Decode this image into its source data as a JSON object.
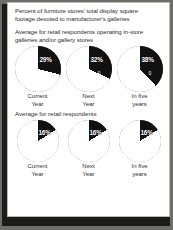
{
  "figure": {
    "title_lines": [
      "Percent of furniture stores' total display square",
      "footage devoted to manufacturer's galleries"
    ],
    "subtitle_lines": [
      "Average for retail respondents operating in-store",
      "galleries and/or gallery stores"
    ],
    "section_label": "Average for retail respondents"
  },
  "chart_data": {
    "type": "pie",
    "title": "Percent of furniture stores' total display square footage devoted to manufacturer's galleries",
    "categories": [
      "Current Year",
      "Next Year",
      "In five years"
    ],
    "series": [
      {
        "name": "Average for retail respondents operating in-store galleries and/or gallery stores",
        "values": [
          29,
          32,
          38
        ],
        "value_labels": [
          "29%",
          "32%",
          "38%"
        ]
      },
      {
        "name": "Average for retail respondents",
        "values": [
          16,
          16,
          16
        ],
        "value_labels": [
          "16%",
          "16%",
          "16%"
        ]
      }
    ],
    "slice_colors": [
      "#111111",
      "#ffffff"
    ],
    "legend": []
  },
  "rows": [
    {
      "label": "Average for retail respondents operating in-store galleries and/or gallery stores",
      "charts": [
        {
          "percent_label": "29%",
          "percent": 29,
          "caption_line1": "Current",
          "caption_line2": "Year",
          "sub_mark": ""
        },
        {
          "percent_label": "32%",
          "percent": 32,
          "caption_line1": "Next",
          "caption_line2": "Year",
          "sub_mark": "0"
        },
        {
          "percent_label": "38%",
          "percent": 38,
          "caption_line1": "In five",
          "caption_line2": "years",
          "sub_mark": "0"
        }
      ]
    },
    {
      "label": "Average for retail respondents",
      "charts": [
        {
          "percent_label": "16%",
          "percent": 16,
          "caption_line1": "Current",
          "caption_line2": "Year",
          "sub_mark": ""
        },
        {
          "percent_label": "16%",
          "percent": 16,
          "caption_line1": "Next",
          "caption_line2": "Year",
          "sub_mark": ""
        },
        {
          "percent_label": "16%",
          "percent": 16,
          "caption_line1": "In five",
          "caption_line2": "years",
          "sub_mark": ""
        }
      ]
    }
  ]
}
